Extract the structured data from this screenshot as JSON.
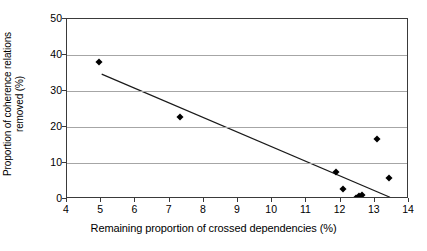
{
  "chart_data": {
    "type": "scatter",
    "title": "",
    "xlabel": "Remaining proportion of crossed dependencies (%)",
    "ylabel_line1": "Proportion of coherence relations",
    "ylabel_line2": "removed (%)",
    "xlim": [
      4,
      14
    ],
    "ylim": [
      0,
      50
    ],
    "xticks": [
      4,
      5,
      6,
      7,
      8,
      9,
      10,
      11,
      12,
      13,
      14
    ],
    "yticks": [
      0,
      10,
      20,
      30,
      40,
      50
    ],
    "grid": "horizontal",
    "legend": "none",
    "marker": "diamond",
    "marker_color": "#000000",
    "points": [
      {
        "x": 4.95,
        "y": 38.0
      },
      {
        "x": 7.3,
        "y": 22.8
      },
      {
        "x": 11.88,
        "y": 7.5
      },
      {
        "x": 12.08,
        "y": 2.8
      },
      {
        "x": 12.45,
        "y": 0.4
      },
      {
        "x": 12.55,
        "y": 0.9
      },
      {
        "x": 12.6,
        "y": 0.3
      },
      {
        "x": 12.62,
        "y": 1.0
      },
      {
        "x": 13.05,
        "y": 16.7
      },
      {
        "x": 13.42,
        "y": 5.8
      }
    ],
    "trendline": {
      "type": "linear",
      "x_start": 5.02,
      "y_start": 34.6,
      "x_end": 13.5,
      "y_end": 0.2,
      "color": "#1a1a1a"
    },
    "axis_color": "#3a3a3a",
    "grid_color": "#a6a6a6",
    "background": "#ffffff"
  }
}
